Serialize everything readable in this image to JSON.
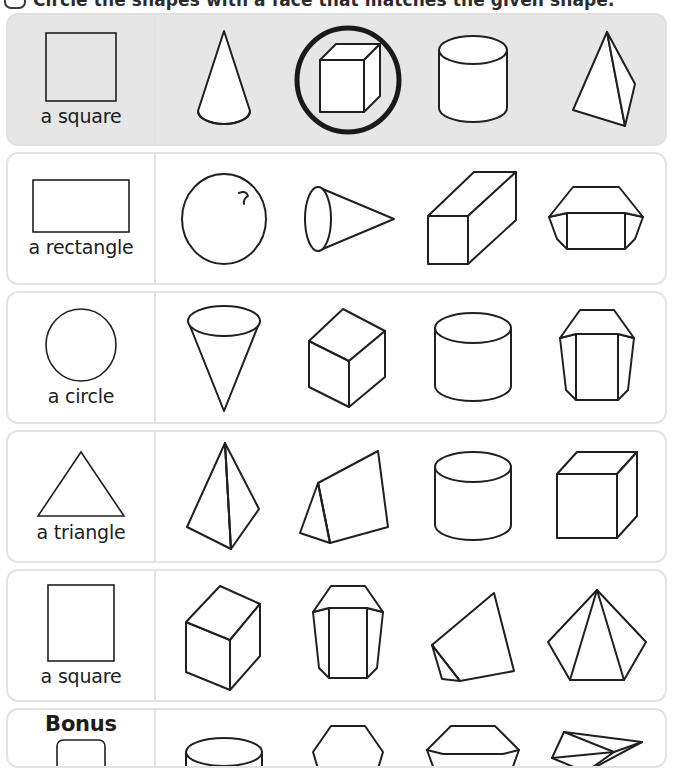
{
  "instruction": {
    "bullet_icon": "oval-bullet-icon",
    "text": "Circle the shapes with a face that matches the given shape."
  },
  "worksheet": {
    "rows": [
      {
        "id": "row-1",
        "label": "a square",
        "label_shape": "square",
        "highlighted": true,
        "answer_circled_index": 1,
        "shapes": [
          "cone",
          "cube",
          "cylinder",
          "triangular-pyramid"
        ]
      },
      {
        "id": "row-2",
        "label": "a rectangle",
        "label_shape": "rectangle",
        "highlighted": false,
        "answer_circled_index": -1,
        "shapes": [
          "sphere",
          "cone-sideways",
          "rectangular-prism",
          "pentagonal-prism-short"
        ]
      },
      {
        "id": "row-3",
        "label": "a circle",
        "label_shape": "circle",
        "highlighted": false,
        "answer_circled_index": -1,
        "shapes": [
          "cone-inverted",
          "cube-tilted",
          "cylinder",
          "pentagonal-prism-tall"
        ]
      },
      {
        "id": "row-4",
        "label": "a triangle",
        "label_shape": "triangle",
        "highlighted": false,
        "answer_circled_index": -1,
        "shapes": [
          "square-pyramid",
          "triangular-prism",
          "cylinder",
          "cube"
        ]
      },
      {
        "id": "row-5",
        "label": "a square",
        "label_shape": "square",
        "highlighted": false,
        "answer_circled_index": -1,
        "shapes": [
          "cube-tilted",
          "hexagonal-prism",
          "triangular-prism-wide",
          "pentagonal-pyramid"
        ]
      },
      {
        "id": "row-bonus",
        "label": "Bonus",
        "label_shape": "rounded-square",
        "label_bold": true,
        "highlighted": false,
        "answer_circled_index": -1,
        "shapes": [
          "cylinder-top",
          "hexagon-top",
          "pentagon-prism-top",
          "flat-prism"
        ]
      }
    ]
  },
  "colors": {
    "ink": "#231f20",
    "card_border": "#e3e3e3",
    "row_highlight": "#e6e6e6",
    "page_background": "#ffffff",
    "answer_mark": "#1a1a1a"
  }
}
